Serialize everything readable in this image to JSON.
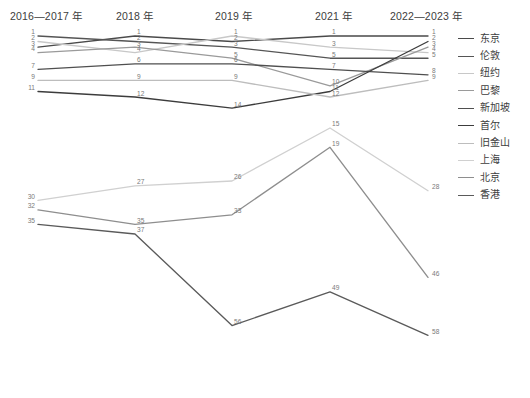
{
  "header": {
    "columns": [
      {
        "label": "2016—2017 年",
        "x": 10
      },
      {
        "label": "2018 年",
        "x": 116
      },
      {
        "label": "2019 年",
        "x": 215
      },
      {
        "label": "2021 年",
        "x": 315
      },
      {
        "label": "2022—2023 年",
        "x": 390
      }
    ]
  },
  "legend": {
    "position": "right",
    "items": [
      {
        "label": "东京",
        "color": "#4a4a4a"
      },
      {
        "label": "伦敦",
        "color": "#555555"
      },
      {
        "label": "纽约",
        "color": "#c8c8c8"
      },
      {
        "label": "巴黎",
        "color": "#9a9a9a"
      },
      {
        "label": "新加坡",
        "color": "#4f4f4f"
      },
      {
        "label": "首尔",
        "color": "#3c3c3c"
      },
      {
        "label": "旧金山",
        "color": "#bdbdbd"
      },
      {
        "label": "上海",
        "color": "#d0d0d0"
      },
      {
        "label": "北京",
        "color": "#8e8e8e"
      },
      {
        "label": "香港",
        "color": "#5a5a5a"
      }
    ]
  },
  "chart_data": {
    "type": "line",
    "title": "",
    "subtitle": "",
    "xlabel": "",
    "ylabel": "",
    "grid": false,
    "legend_position": "right",
    "categories": [
      "2016—2017 年",
      "2018 年",
      "2019 年",
      "2021 年",
      "2022—2023 年"
    ],
    "note": "Bump / parallel-coordinates chart of city ranks (lower value = higher rank). Two visual groups: top cluster (ranks 1-14) and lower cluster (ranks 15-58).",
    "series": [
      {
        "name": "东京",
        "color": "#4a4a4a",
        "values": [
          3,
          1,
          2,
          1,
          1
        ]
      },
      {
        "name": "伦敦",
        "color": "#555555",
        "values": [
          1,
          2,
          3,
          5,
          5
        ]
      },
      {
        "name": "纽约",
        "color": "#c8c8c8",
        "values": [
          2,
          4,
          1,
          3,
          4
        ]
      },
      {
        "name": "巴黎",
        "color": "#9a9a9a",
        "values": [
          4,
          3,
          5,
          10,
          3
        ]
      },
      {
        "name": "新加坡",
        "color": "#4f4f4f",
        "values": [
          7,
          6,
          6,
          7,
          8
        ]
      },
      {
        "name": "首尔",
        "color": "#3c3c3c",
        "values": [
          11,
          12,
          14,
          11,
          2
        ]
      },
      {
        "name": "旧金山",
        "color": "#bdbdbd",
        "values": [
          9,
          9,
          9,
          12,
          9
        ]
      },
      {
        "name": "上海",
        "color": "#d0d0d0",
        "values": [
          30,
          27,
          26,
          15,
          28
        ]
      },
      {
        "name": "北京",
        "color": "#8e8e8e",
        "values": [
          32,
          35,
          33,
          19,
          46
        ]
      },
      {
        "name": "香港",
        "color": "#5a5a5a",
        "values": [
          35,
          37,
          56,
          49,
          58
        ]
      }
    ],
    "point_labels": {
      "东京": [
        "3",
        "1",
        "2",
        "1",
        "1"
      ],
      "伦敦": [
        "1",
        "2",
        "3",
        "5",
        "5"
      ],
      "纽约": [
        "2",
        "4",
        "1",
        "3",
        "4"
      ],
      "巴黎": [
        "4",
        "3",
        "5",
        "10",
        "3"
      ],
      "新加坡": [
        "7",
        "6",
        "6",
        "7",
        "8"
      ],
      "首尔": [
        "11",
        "12",
        "14",
        "11",
        "2"
      ],
      "旧金山": [
        "9",
        "9",
        "9",
        "12",
        "9"
      ],
      "上海": [
        "30",
        "27",
        "26",
        "15",
        "28"
      ],
      "北京": [
        "32",
        "35",
        "33",
        "19",
        "46"
      ],
      "香港": [
        "35",
        "37",
        "56",
        "49",
        "58"
      ]
    }
  }
}
